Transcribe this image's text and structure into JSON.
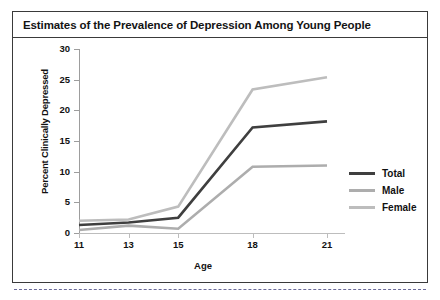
{
  "card": {
    "title": "Estimates of the Prevalence of Depression Among Young People"
  },
  "chart_data": {
    "type": "line",
    "title": "Estimates of the Prevalence of Depression Among Young People",
    "xlabel": "Age",
    "ylabel": "Percent Clinically Depressed",
    "x": [
      11,
      13,
      15,
      18,
      21
    ],
    "xticklabels": [
      "11",
      "13",
      "15",
      "18",
      "21"
    ],
    "yticks": [
      0,
      5,
      10,
      15,
      20,
      25,
      30
    ],
    "yticklabels": [
      "0",
      "5",
      "10",
      "15",
      "20",
      "25",
      "30"
    ],
    "xlim": [
      11,
      21
    ],
    "ylim": [
      0,
      30
    ],
    "grid": false,
    "legend_position": "right",
    "series": [
      {
        "name": "Total",
        "color": "#3f3f3f",
        "values": [
          1.3,
          1.7,
          2.5,
          17.2,
          18.2
        ]
      },
      {
        "name": "Male",
        "color": "#adadad",
        "values": [
          0.5,
          1.2,
          0.7,
          10.8,
          11.0
        ]
      },
      {
        "name": "Female",
        "color": "#bdbdbd",
        "values": [
          2.0,
          2.2,
          4.3,
          23.4,
          25.4
        ]
      }
    ]
  },
  "legend": {
    "items": [
      {
        "label": "Total",
        "color": "#3f3f3f"
      },
      {
        "label": "Male",
        "color": "#adadad"
      },
      {
        "label": "Female",
        "color": "#bdbdbd"
      }
    ]
  }
}
